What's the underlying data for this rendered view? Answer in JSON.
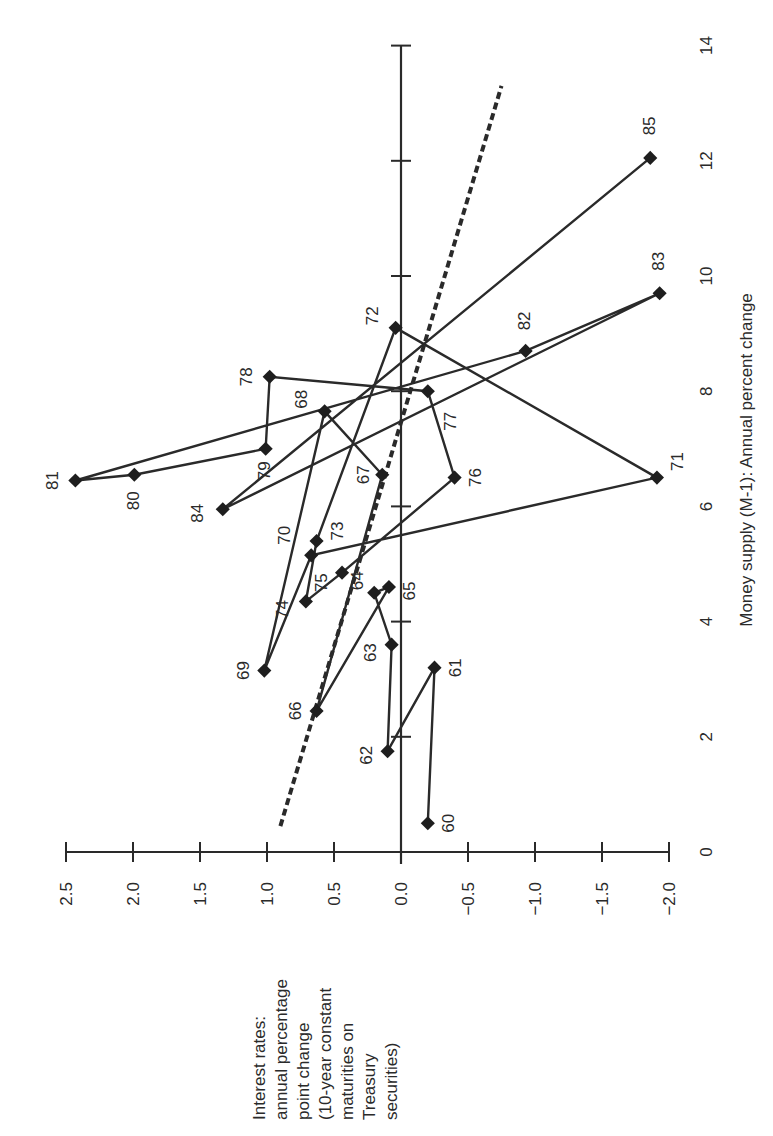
{
  "chart_data": {
    "type": "scatter",
    "orientation": "rotated -90 degrees (x-axis vertical on right, y-axis horizontal at bottom)",
    "title": "",
    "xlabel": "Money supply (M-1): Annual percent change",
    "ylabel": "Interest rates: annual percentage point change (10-year constant maturities on Treasury securities)",
    "ylabel_lines": [
      "Interest rates:",
      "annual percentage",
      "point change",
      "(10-year constant",
      "maturities on",
      "Treasury",
      "securities)"
    ],
    "xlim": [
      0,
      14
    ],
    "ylim": [
      -2.0,
      2.5
    ],
    "x_ticks": [
      0,
      2,
      4,
      6,
      8,
      10,
      12,
      14
    ],
    "x_tick_labels": [
      "0",
      "2",
      "4",
      "6",
      "8",
      "10",
      "12",
      "14"
    ],
    "y_ticks": [
      2.5,
      2.0,
      1.5,
      1.0,
      0.5,
      0.0,
      -0.5,
      -1.0,
      -1.5,
      -2.0
    ],
    "y_tick_labels": [
      "2.5",
      "2.0",
      "1.5",
      "1.0",
      "0.5",
      "0.0",
      "−0.5",
      "−1.0",
      "−1.5",
      "−2.0"
    ],
    "grid": false,
    "zero_line": true,
    "series": [
      {
        "name": "Annual observations 1960-1985 (connected in year order)",
        "marker": "diamond",
        "connected": true,
        "points": [
          {
            "label": "60",
            "x": 0.5,
            "y": -0.2
          },
          {
            "label": "61",
            "x": 3.2,
            "y": -0.25
          },
          {
            "label": "62",
            "x": 1.75,
            "y": 0.1
          },
          {
            "label": "63",
            "x": 3.6,
            "y": 0.07
          },
          {
            "label": "64",
            "x": 4.5,
            "y": 0.2
          },
          {
            "label": "65",
            "x": 4.6,
            "y": 0.09
          },
          {
            "label": "66",
            "x": 2.45,
            "y": 0.63
          },
          {
            "label": "67",
            "x": 6.55,
            "y": 0.14
          },
          {
            "label": "68",
            "x": 7.65,
            "y": 0.57
          },
          {
            "label": "69",
            "x": 3.15,
            "y": 1.02
          },
          {
            "label": "70",
            "x": 5.15,
            "y": 0.67
          },
          {
            "label": "71",
            "x": 6.5,
            "y": -1.91
          },
          {
            "label": "72",
            "x": 9.1,
            "y": 0.04
          },
          {
            "label": "73",
            "x": 5.4,
            "y": 0.63
          },
          {
            "label": "74",
            "x": 4.35,
            "y": 0.71
          },
          {
            "label": "75",
            "x": 4.85,
            "y": 0.44
          },
          {
            "label": "76",
            "x": 6.5,
            "y": -0.4
          },
          {
            "label": "77",
            "x": 8.0,
            "y": -0.2
          },
          {
            "label": "78",
            "x": 8.25,
            "y": 0.98
          },
          {
            "label": "79",
            "x": 7.0,
            "y": 1.01
          },
          {
            "label": "80",
            "x": 6.55,
            "y": 1.99
          },
          {
            "label": "81",
            "x": 6.45,
            "y": 2.43
          },
          {
            "label": "82",
            "x": 8.7,
            "y": -0.93
          },
          {
            "label": "83",
            "x": 9.7,
            "y": -1.93
          },
          {
            "label": "84",
            "x": 5.95,
            "y": 1.33
          },
          {
            "label": "85",
            "x": 12.05,
            "y": -1.86
          }
        ]
      },
      {
        "name": "Trend (regression) line",
        "style": "dashed",
        "points": [
          {
            "x": 0.45,
            "y": 0.9
          },
          {
            "x": 13.3,
            "y": -0.75
          }
        ]
      }
    ]
  }
}
